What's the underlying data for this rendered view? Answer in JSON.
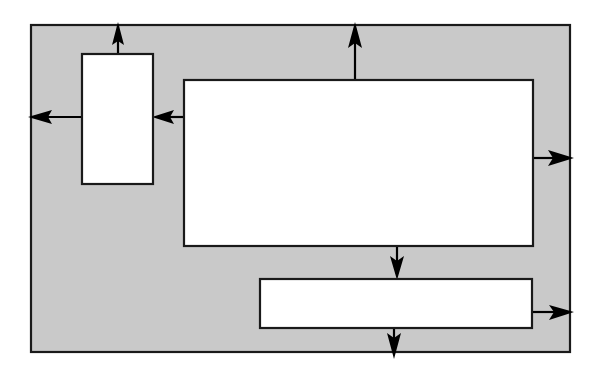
{
  "diagram": {
    "type": "block-diagram",
    "title": "",
    "canvas": {
      "width": 594,
      "height": 377,
      "background": "#ffffff"
    },
    "colors": {
      "enclosure_fill": "#c9c9c9",
      "box_fill": "#ffffff",
      "stroke": "#1a1a1a",
      "arrow": "#000000"
    },
    "enclosure": {
      "label": "",
      "x": 31,
      "y": 25,
      "width": 539,
      "height": 327
    },
    "nodes": [
      {
        "id": "left-box",
        "label": "",
        "x": 82,
        "y": 54,
        "width": 71,
        "height": 130
      },
      {
        "id": "main-box",
        "label": "",
        "x": 184,
        "y": 80,
        "width": 349,
        "height": 166
      },
      {
        "id": "bottom-box",
        "label": "",
        "x": 260,
        "y": 279,
        "width": 272,
        "height": 49
      }
    ],
    "arrows": [
      {
        "id": "left-box-up-out",
        "label": "",
        "from": "left-box",
        "to": "outside-top",
        "direction": "up",
        "x1": 118,
        "y1": 54,
        "x2": 118,
        "y2": 22
      },
      {
        "id": "left-box-left-out",
        "label": "",
        "from": "left-box",
        "to": "outside-left",
        "direction": "left",
        "x1": 82,
        "y1": 117,
        "x2": 28,
        "y2": 117
      },
      {
        "id": "main-to-left-box",
        "label": "",
        "from": "main-box",
        "to": "left-box",
        "direction": "left",
        "x1": 184,
        "y1": 117,
        "x2": 153,
        "y2": 117
      },
      {
        "id": "main-box-up-out",
        "label": "",
        "from": "main-box",
        "to": "outside-top",
        "direction": "up",
        "x1": 355,
        "y1": 80,
        "x2": 355,
        "y2": 22
      },
      {
        "id": "main-box-right-out",
        "label": "",
        "from": "main-box",
        "to": "outside-right",
        "direction": "right",
        "x1": 533,
        "y1": 158,
        "x2": 573,
        "y2": 158
      },
      {
        "id": "main-to-bottom-box",
        "label": "",
        "from": "main-box",
        "to": "bottom-box",
        "direction": "down",
        "x1": 397,
        "y1": 246,
        "x2": 397,
        "y2": 279
      },
      {
        "id": "bottom-box-right-out",
        "label": "",
        "from": "bottom-box",
        "to": "outside-right",
        "direction": "right",
        "x1": 532,
        "y1": 312,
        "x2": 573,
        "y2": 312
      },
      {
        "id": "bottom-box-down-out",
        "label": "",
        "from": "bottom-box",
        "to": "outside-bottom",
        "direction": "down",
        "x1": 394,
        "y1": 328,
        "x2": 394,
        "y2": 358
      }
    ]
  }
}
